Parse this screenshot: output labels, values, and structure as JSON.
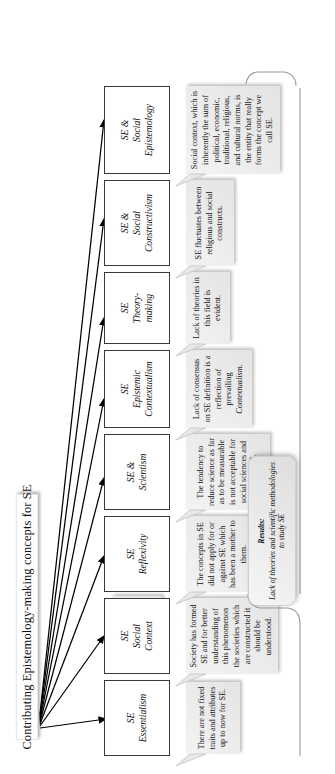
{
  "diagram": {
    "title": "Contributing Epistemology-making concepts for SE",
    "orientation_deg": -90,
    "colors": {
      "node_border": "#3a3a3a",
      "node_fill": "#ffffff",
      "desc_fill": "#e8e8e8",
      "arrow": "#000000",
      "title_fill": "#fefefe"
    },
    "nodes": [
      {
        "id": "essentialism",
        "label": "SE\nEssentialism",
        "label_line1": "SE",
        "label_line2": "Essentialism",
        "description": "There are not fixed traits and attributes up to now for SE."
      },
      {
        "id": "social-context",
        "label": "SE\nSocial\nContext",
        "label_line1": "SE",
        "label_line2": "Social",
        "label_line3": "Context",
        "description": "Society has formed SE and for better understanding of this phenomenon the societies which are constructed it should be understood."
      },
      {
        "id": "reflexivity",
        "label": "SE\nReflexivity",
        "label_line1": "SE",
        "label_line2": "Reflexivity",
        "description": "The concepts in SE did not apply for or against SE which has been a mother to them."
      },
      {
        "id": "scientism",
        "label": "SE &\nScientism",
        "label_line1": "SE &",
        "label_line2": "Scientism",
        "description": "The tendency to reduce science as far as to be measurable is not acceptable for social sciences and hence, SE."
      },
      {
        "id": "epistemic-contextualism",
        "label": "SE\nEpistemic\nContextualism",
        "label_line1": "SE",
        "label_line2": "Epistemic",
        "label_line3": "Contextualism",
        "description_pre": "Lack of consensus on SE definition is a reflection of prevailing ",
        "description_em": "Contextualism.",
        "description": "Lack of consensus on SE definition is a reflection of prevailing Contextualism."
      },
      {
        "id": "theory-making",
        "label": "SE\nTheory-\nmaking",
        "label_line1": "SE",
        "label_line2": "Theory-",
        "label_line3": "making",
        "description": "Lack of theories in this field is evident."
      },
      {
        "id": "social-constructivism",
        "label": "SE &\nSocial\nConstructivism",
        "label_line1": "SE &",
        "label_line2": "Social",
        "label_line3": "Constructivism",
        "description": "SE fluctuates between religious and social constructs."
      },
      {
        "id": "social-epistemology",
        "label": "SE &\nSocial\nEpistemology",
        "label_line1": "SE &",
        "label_line2": "Social",
        "label_line3": "Epistemology",
        "description": "Social context, which is inherently the sum of political, economic, traditional, religious, and cultural norms, is the entity that really forms the concept we call SE."
      }
    ],
    "results": {
      "label": "Results:",
      "text": "Lack of theories and scientific methodologies to study SE"
    }
  }
}
